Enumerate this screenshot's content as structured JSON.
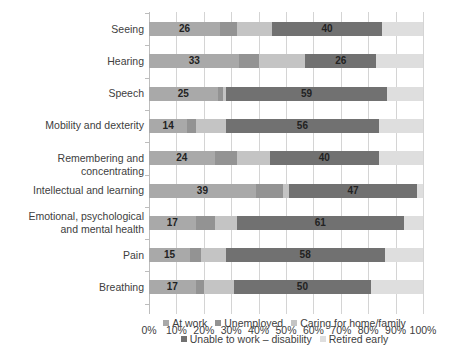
{
  "chart_data": {
    "type": "bar",
    "orientation": "horizontal",
    "stacked": true,
    "title": "",
    "xlabel": "",
    "ylabel": "",
    "xlim": [
      0,
      100
    ],
    "x_ticks": [
      "0%",
      "10%",
      "20%",
      "30%",
      "40%",
      "50%",
      "60%",
      "70%",
      "80%",
      "90%",
      "100%"
    ],
    "grid": true,
    "legend_position": "bottom",
    "categories": [
      "Seeing",
      "Hearing",
      "Speech",
      "Mobility and dexterity",
      "Remembering and concentrating",
      "Intellectual and learning",
      "Emotional, psychological\nand mental health",
      "Pain",
      "Breathing"
    ],
    "series": [
      {
        "name": "At work",
        "color": "#a9a9a9",
        "values": [
          26,
          33,
          25,
          14,
          24,
          39,
          17,
          15,
          17
        ],
        "labeled": true
      },
      {
        "name": "Unemployed",
        "color": "#939393",
        "values": [
          6,
          7,
          2,
          3,
          8,
          10,
          7,
          4,
          3
        ],
        "labeled": false
      },
      {
        "name": "Caring for home/family",
        "color": "#c4c4c4",
        "values": [
          13,
          17,
          1,
          11,
          12,
          2,
          8,
          9,
          11
        ],
        "labeled": false
      },
      {
        "name": "Unable to work – disability",
        "color": "#717171",
        "values": [
          40,
          26,
          59,
          56,
          40,
          47,
          61,
          58,
          50
        ],
        "labeled": true
      },
      {
        "name": "Retired early",
        "color": "#dedede",
        "values": [
          15,
          17,
          13,
          16,
          16,
          2,
          7,
          14,
          19
        ],
        "labeled": false
      }
    ]
  },
  "legend": {
    "row1": [
      0,
      1,
      2
    ],
    "row2": [
      3,
      4
    ]
  }
}
